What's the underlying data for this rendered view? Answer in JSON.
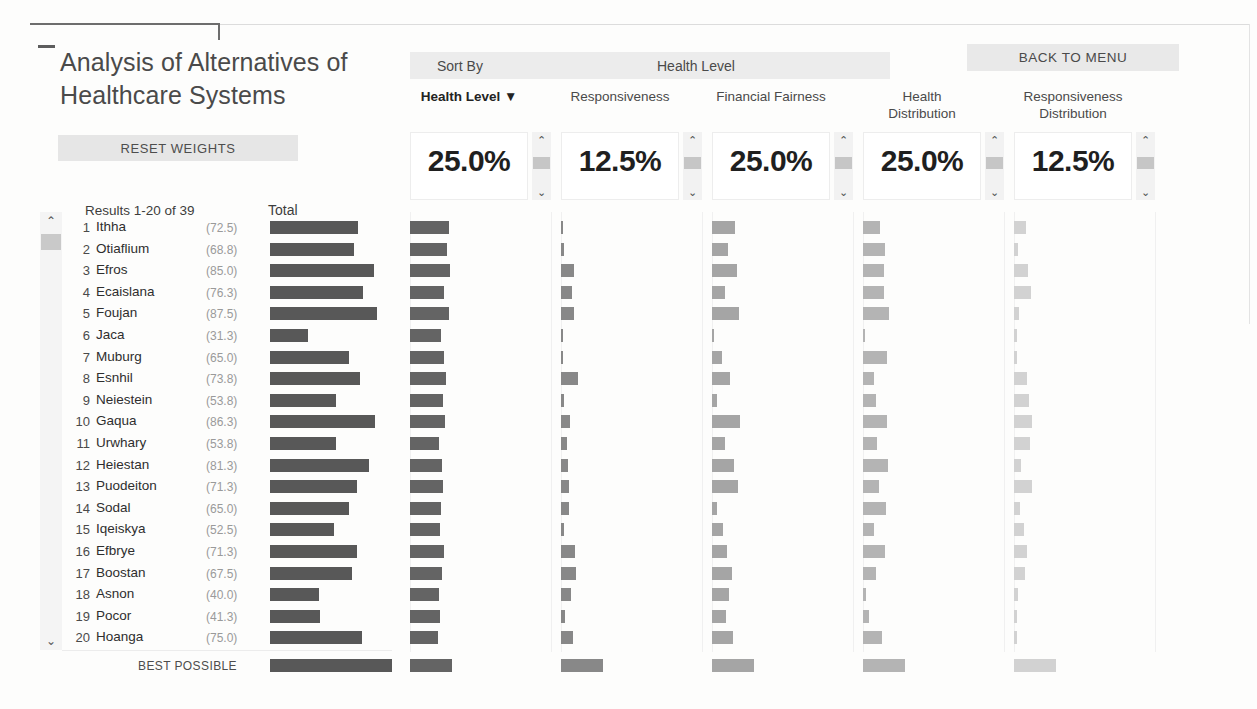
{
  "header": {
    "title": "Analysis of Alternatives of Healthcare Systems",
    "reset_label": "RESET WEIGHTS",
    "back_label": "BACK TO MENU",
    "sort_by_label": "Sort By",
    "sort_by_value": "Health Level"
  },
  "results": {
    "count_label": "Results 1-20 of 39",
    "total_header": "Total",
    "best_possible_label": "BEST POSSIBLE"
  },
  "icons": {
    "chevron_up": "⌃",
    "chevron_down": "⌄",
    "sort_desc": "▼"
  },
  "criteria": [
    {
      "name": "Health Level",
      "weight": "25.0%",
      "sorted": true,
      "sort_indicator": "▼"
    },
    {
      "name": "Responsiveness",
      "weight": "12.5%",
      "sorted": false,
      "sort_indicator": ""
    },
    {
      "name": "Financial Fairness",
      "weight": "25.0%",
      "sorted": false,
      "sort_indicator": ""
    },
    {
      "name": "Health Distribution",
      "weight": "25.0%",
      "sorted": false,
      "sort_indicator": ""
    },
    {
      "name": "Responsiveness Distribution",
      "weight": "12.5%",
      "sorted": false,
      "sort_indicator": ""
    }
  ],
  "chart_data": {
    "type": "bar",
    "title": "Analysis of Alternatives of Healthcare Systems",
    "xlabel": "",
    "ylabel": "",
    "sorted_by": "Health Level",
    "total_max": 100,
    "criteria_max": 100,
    "series_colors": [
      "#646464",
      "#888888",
      "#a5a5a5",
      "#b4b4b4",
      "#d2d2d2"
    ],
    "total_color": "#585858",
    "columns": [
      "Health Level",
      "Responsiveness",
      "Financial Fairness",
      "Health Distribution",
      "Responsiveness Distribution"
    ],
    "rows": [
      {
        "rank": 1,
        "name": "Ithha",
        "total": 72.5,
        "score_label": "(72.5)",
        "values": [
          92,
          4,
          55,
          40,
          28
        ]
      },
      {
        "rank": 2,
        "name": "Otiaflium",
        "total": 68.8,
        "score_label": "(68.8)",
        "values": [
          88,
          8,
          38,
          52,
          10
        ]
      },
      {
        "rank": 3,
        "name": "Efros",
        "total": 85.0,
        "score_label": "(85.0)",
        "values": [
          96,
          30,
          60,
          50,
          34
        ]
      },
      {
        "rank": 4,
        "name": "Ecaislana",
        "total": 76.3,
        "score_label": "(76.3)",
        "values": [
          80,
          26,
          32,
          50,
          40
        ]
      },
      {
        "rank": 5,
        "name": "Foujan",
        "total": 87.5,
        "score_label": "(87.5)",
        "values": [
          92,
          32,
          64,
          62,
          12
        ]
      },
      {
        "rank": 6,
        "name": "Jaca",
        "total": 31.3,
        "score_label": "(31.3)",
        "values": [
          74,
          5,
          4,
          5,
          6
        ]
      },
      {
        "rank": 7,
        "name": "Muburg",
        "total": 65.0,
        "score_label": "(65.0)",
        "values": [
          82,
          4,
          24,
          58,
          8
        ]
      },
      {
        "rank": 8,
        "name": "Esnhil",
        "total": 73.8,
        "score_label": "(73.8)",
        "values": [
          86,
          40,
          42,
          26,
          30
        ]
      },
      {
        "rank": 9,
        "name": "Neiestein",
        "total": 53.8,
        "score_label": "(53.8)",
        "values": [
          78,
          6,
          12,
          30,
          36
        ]
      },
      {
        "rank": 10,
        "name": "Gaqua",
        "total": 86.3,
        "score_label": "(86.3)",
        "values": [
          84,
          22,
          66,
          56,
          44
        ]
      },
      {
        "rank": 11,
        "name": "Urwhary",
        "total": 53.8,
        "score_label": "(53.8)",
        "values": [
          70,
          14,
          30,
          34,
          38
        ]
      },
      {
        "rank": 12,
        "name": "Heiestan",
        "total": 81.3,
        "score_label": "(81.3)",
        "values": [
          76,
          16,
          52,
          60,
          16
        ]
      },
      {
        "rank": 13,
        "name": "Puodeiton",
        "total": 71.3,
        "score_label": "(71.3)",
        "values": [
          78,
          18,
          62,
          38,
          42
        ]
      },
      {
        "rank": 14,
        "name": "Sodal",
        "total": 65.0,
        "score_label": "(65.0)",
        "values": [
          74,
          20,
          12,
          54,
          14
        ]
      },
      {
        "rank": 15,
        "name": "Iqeiskya",
        "total": 52.5,
        "score_label": "(52.5)",
        "values": [
          72,
          6,
          26,
          26,
          24
        ]
      },
      {
        "rank": 16,
        "name": "Efbrye",
        "total": 71.3,
        "score_label": "(71.3)",
        "values": [
          80,
          34,
          36,
          52,
          30
        ]
      },
      {
        "rank": 17,
        "name": "Boostan",
        "total": 67.5,
        "score_label": "(67.5)",
        "values": [
          76,
          36,
          48,
          32,
          26
        ]
      },
      {
        "rank": 18,
        "name": "Asnon",
        "total": 40.0,
        "score_label": "(40.0)",
        "values": [
          70,
          24,
          40,
          6,
          10
        ]
      },
      {
        "rank": 19,
        "name": "Pocor",
        "total": 41.3,
        "score_label": "(41.3)",
        "values": [
          72,
          10,
          34,
          14,
          6
        ]
      },
      {
        "rank": 20,
        "name": "Hoanga",
        "total": 75.0,
        "score_label": "(75.0)",
        "values": [
          66,
          28,
          50,
          46,
          8
        ]
      }
    ],
    "best_possible": {
      "total": 100,
      "values": [
        100,
        100,
        100,
        100,
        100
      ]
    }
  }
}
